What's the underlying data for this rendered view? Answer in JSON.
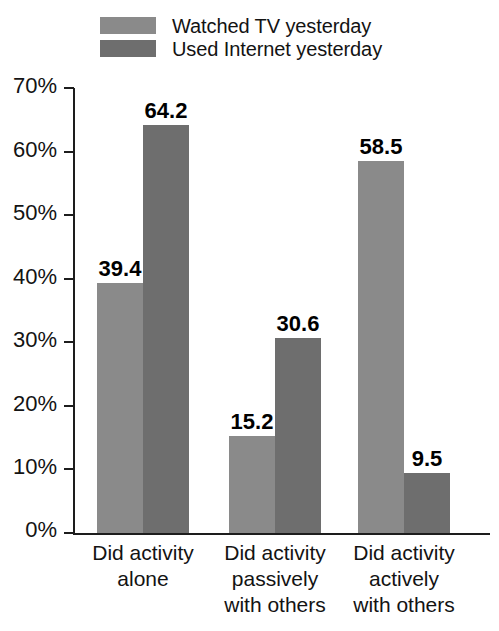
{
  "chart_data": {
    "type": "bar",
    "title": "",
    "subtitle": "",
    "xlabel": "",
    "ylabel": "",
    "ylim": [
      0,
      70
    ],
    "ytick_labels": [
      "70%",
      "60%",
      "50%",
      "40%",
      "30%",
      "20%",
      "10%",
      "0%"
    ],
    "ytick_values": [
      70,
      60,
      50,
      40,
      30,
      20,
      10,
      0
    ],
    "grid": false,
    "legend_position": "top-left",
    "categories": [
      "Did activity alone",
      "Did activity passively with others",
      "Did activity actively with others"
    ],
    "category_lines": [
      [
        "Did activity",
        "alone"
      ],
      [
        "Did activity",
        "passively",
        "with others"
      ],
      [
        "Did activity",
        "actively",
        "with others"
      ]
    ],
    "series": [
      {
        "name": "Watched TV yesterday",
        "color": "#8a8a8a",
        "values": [
          39.4,
          15.2,
          58.5
        ],
        "labels": [
          "39.4",
          "15.2",
          "58.5"
        ]
      },
      {
        "name": "Used Internet yesterday",
        "color": "#6e6e6e",
        "values": [
          64.2,
          30.6,
          9.5
        ],
        "labels": [
          "64.2",
          "30.6",
          "9.5"
        ]
      }
    ]
  },
  "legend": {
    "items": [
      {
        "label": "Watched TV yesterday",
        "color": "#8a8a8a"
      },
      {
        "label": "Used Internet yesterday",
        "color": "#6e6e6e"
      }
    ]
  },
  "axis": {
    "ticks": [
      {
        "label": "70%",
        "value": 70
      },
      {
        "label": "60%",
        "value": 60
      },
      {
        "label": "50%",
        "value": 50
      },
      {
        "label": "40%",
        "value": 40
      },
      {
        "label": "30%",
        "value": 30
      },
      {
        "label": "20%",
        "value": 20
      },
      {
        "label": "10%",
        "value": 10
      },
      {
        "label": "0%",
        "value": 0
      }
    ]
  }
}
